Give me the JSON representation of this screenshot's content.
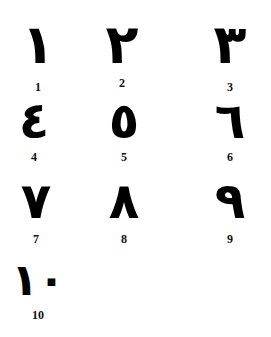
{
  "numerals": [
    {
      "arabic": "١",
      "label": "1"
    },
    {
      "arabic": "٢",
      "label": "2"
    },
    {
      "arabic": "٣",
      "label": "3"
    },
    {
      "arabic": "٤",
      "label": "4"
    },
    {
      "arabic": "٥",
      "label": "5"
    },
    {
      "arabic": "٦",
      "label": "6"
    },
    {
      "arabic": "٧",
      "label": "7"
    },
    {
      "arabic": "٨",
      "label": "8"
    },
    {
      "arabic": "٩",
      "label": "9"
    },
    {
      "arabic": "١٠",
      "label": "10"
    }
  ]
}
